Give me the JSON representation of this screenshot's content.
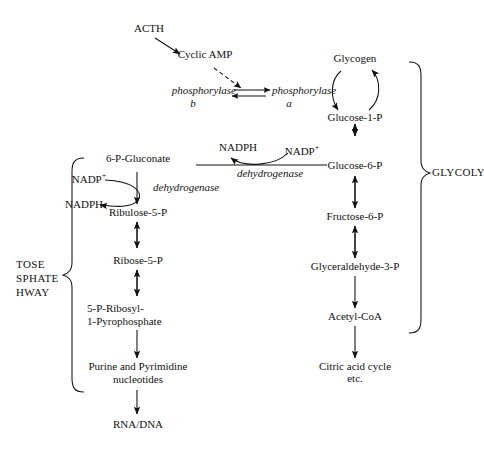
{
  "diagram": {
    "ink_color": "#111111",
    "background": "#ffffff"
  },
  "nodes": {
    "acth": "ACTH",
    "cyclic_amp": "Cyclic AMP",
    "phosphorylase_b_main": "phosphorylase",
    "phosphorylase_b_sub": "b",
    "phosphorylase_a_main": "phosphorylase",
    "phosphorylase_a_sub": "a",
    "glycogen": "Glycogen",
    "glucose_1_p": "Glucose-1-P",
    "glucose_6_p": "Glucose-6-P",
    "fructose_6_p": "Fructose-6-P",
    "glyceraldehyde_3_p": "Glyceraldehyde-3-P",
    "acetyl_coa": "Acetyl-CoA",
    "citric_acid_cycle_line1": "Citric acid cycle",
    "citric_acid_cycle_line2": "etc.",
    "six_p_gluconate": "6-P-Gluconate",
    "ribulose_5_p": "Ribulose-5-P",
    "ribose_5_p": "Ribose-5-P",
    "prpp_line1": "5-P-Ribosyl-",
    "prpp_line2": "1-Pyrophosphate",
    "purine_pyrimidine_line1": "Purine and Pyrimidine",
    "purine_pyrimidine_line2": "nucleotides",
    "rna_dna": "RNA/DNA"
  },
  "cofactors": {
    "nadph_top": "NADPH",
    "nadp_plus_top": "NADP",
    "nadp_plus_top_charge": "+",
    "nadp_plus_left": "NADP",
    "nadp_plus_left_charge": "+",
    "nadph_left": "NADPH"
  },
  "enzymes": {
    "dehydrogenase_top": "dehydrogenase",
    "dehydrogenase_left": "dehydrogenase"
  },
  "braces": {
    "left_label_line1": "TOSE",
    "left_label_line2": "SPHATE",
    "left_label_line3": "HWAY",
    "right_label": "GLYCOLY"
  }
}
